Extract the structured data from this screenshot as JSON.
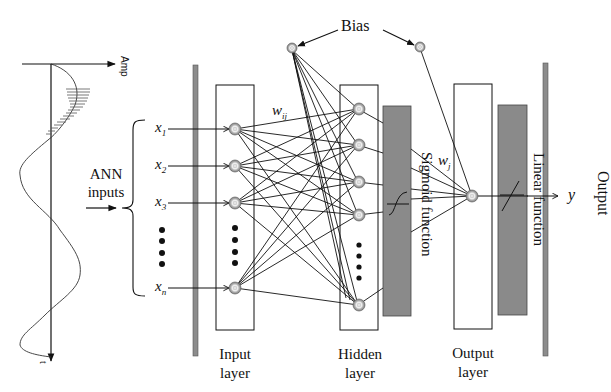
{
  "diagram": {
    "type": "artificial-neural-network",
    "signal": {
      "axis_amp_label": "Amp",
      "axis_time_label": "t"
    },
    "inputs": {
      "group_label_line1": "ANN",
      "group_label_line2": "inputs",
      "items": [
        "x1",
        "x2",
        "x3",
        "xn"
      ],
      "subscripts": [
        "1",
        "2",
        "3",
        "n"
      ],
      "base": "x"
    },
    "bias_label": "Bias",
    "weights": {
      "input_hidden": "w",
      "input_hidden_sub": "ij",
      "hidden_output": "w",
      "hidden_output_sub": "j"
    },
    "functions": {
      "hidden": "Sigmoid function",
      "output": "Linear function"
    },
    "output": {
      "symbol": "y",
      "label": "Output"
    },
    "layers": [
      {
        "line1": "Input",
        "line2": "layer"
      },
      {
        "line1": "Hidden",
        "line2": "layer"
      },
      {
        "line1": "Output",
        "line2": "layer"
      }
    ],
    "colors": {
      "function_box": "#8a8a8a",
      "bar": "#8c8c8c",
      "node_outer": "#9a9a9a",
      "line": "#111111"
    }
  }
}
